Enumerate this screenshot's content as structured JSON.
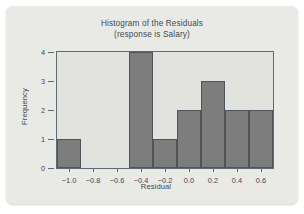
{
  "chart_data": {
    "type": "bar",
    "title": "Histogram of the Residuals",
    "subtitle": "(response is Salary)",
    "xlabel": "Residual",
    "ylabel": "Frequency",
    "xlim": [
      -1.1,
      0.7
    ],
    "ylim": [
      0,
      4
    ],
    "grid": false,
    "legend": null,
    "bin_width": 0.2,
    "xticks": [
      "-1.0",
      "-0.8",
      "-0.6",
      "-0.4",
      "-0.2",
      "0.0",
      "0.2",
      "0.4",
      "0.6"
    ],
    "xtick_values": [
      -1.0,
      -0.8,
      -0.6,
      -0.4,
      -0.2,
      0.0,
      0.2,
      0.4,
      0.6
    ],
    "yticks": [
      "0",
      "1",
      "2",
      "3",
      "4"
    ],
    "ytick_values": [
      0,
      1,
      2,
      3,
      4
    ],
    "bins": [
      {
        "left": -1.1,
        "right": -0.9,
        "center": -1.0,
        "value": 1
      },
      {
        "left": -0.9,
        "right": -0.7,
        "center": -0.8,
        "value": 0
      },
      {
        "left": -0.7,
        "right": -0.5,
        "center": -0.6,
        "value": 0
      },
      {
        "left": -0.5,
        "right": -0.3,
        "center": -0.4,
        "value": 4
      },
      {
        "left": -0.3,
        "right": -0.1,
        "center": -0.2,
        "value": 1
      },
      {
        "left": -0.1,
        "right": 0.1,
        "center": 0.0,
        "value": 2
      },
      {
        "left": 0.1,
        "right": 0.3,
        "center": 0.2,
        "value": 3
      },
      {
        "left": 0.3,
        "right": 0.5,
        "center": 0.4,
        "value": 2
      },
      {
        "left": 0.5,
        "right": 0.7,
        "center": 0.6,
        "value": 2
      }
    ],
    "colors": {
      "bar_fill": "#7d7d7d",
      "bar_edge": "#4d545a",
      "plot_background": "#e2e2df",
      "card_background": "#e9e9e6",
      "axis": "#5d6a72",
      "text": "#3f4a52"
    }
  }
}
